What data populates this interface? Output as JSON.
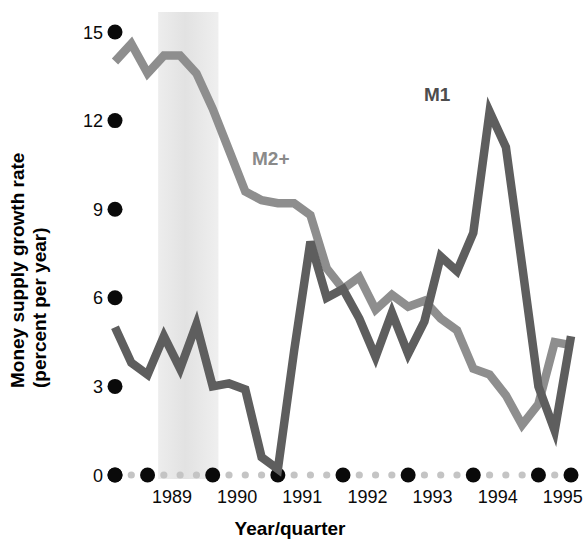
{
  "chart_data": {
    "type": "line",
    "title": "",
    "xlabel": "Year/quarter",
    "ylabel": "Money supply growth rate (percent per year)",
    "ylabel_line1": "Money supply growth rate",
    "ylabel_line2": "(percent per year)",
    "ylim": [
      0,
      15
    ],
    "yticks": [
      0,
      3,
      6,
      9,
      12,
      15
    ],
    "ytick_labels": [
      "0",
      "3",
      "6",
      "9",
      "12",
      "15"
    ],
    "xtick_labels": [
      "1989",
      "1990",
      "1991",
      "1992",
      "1993",
      "1994",
      "1995"
    ],
    "grid": false,
    "legend_position": "inline-annotation",
    "x_quarters": [
      "1988Q3",
      "1988Q4",
      "1989Q1",
      "1989Q2",
      "1989Q3",
      "1989Q4",
      "1990Q1",
      "1990Q2",
      "1990Q3",
      "1990Q4",
      "1991Q1",
      "1991Q2",
      "1991Q3",
      "1991Q4",
      "1992Q1",
      "1992Q2",
      "1992Q3",
      "1992Q4",
      "1993Q1",
      "1993Q2",
      "1993Q3",
      "1993Q4",
      "1994Q1",
      "1994Q2",
      "1994Q3",
      "1994Q4",
      "1995Q1",
      "1995Q2",
      "1995Q3"
    ],
    "series": [
      {
        "name": "M1",
        "color": "#5e5e5e",
        "label": "M1",
        "label_color": "#4d4d4d",
        "values": [
          5.0,
          3.8,
          3.4,
          4.7,
          3.6,
          5.1,
          3.0,
          3.1,
          2.9,
          0.6,
          0.2,
          4.2,
          7.9,
          6.0,
          6.3,
          5.3,
          4.0,
          5.5,
          4.1,
          5.2,
          7.4,
          6.9,
          8.2,
          12.3,
          11.1,
          7.1,
          3.0,
          1.5,
          4.7
        ]
      },
      {
        "name": "M2+",
        "color": "#8e8e8e",
        "label": "M2+",
        "label_color": "#8a8a8a",
        "values": [
          14.0,
          14.6,
          13.6,
          14.2,
          14.2,
          13.6,
          12.4,
          11.0,
          9.6,
          9.3,
          9.2,
          9.2,
          8.8,
          7.0,
          6.3,
          6.7,
          5.6,
          6.1,
          5.7,
          5.9,
          5.3,
          4.9,
          3.6,
          3.4,
          2.7,
          1.7,
          2.4,
          4.5,
          4.4
        ]
      }
    ],
    "shaded_band": {
      "label": "recession-band",
      "start_quarter": "1989Q2",
      "end_quarter": "1990Q1",
      "color": "#e6e6e6"
    }
  },
  "annotations": {
    "m1_label": "M1",
    "m2_label": "M2+"
  }
}
